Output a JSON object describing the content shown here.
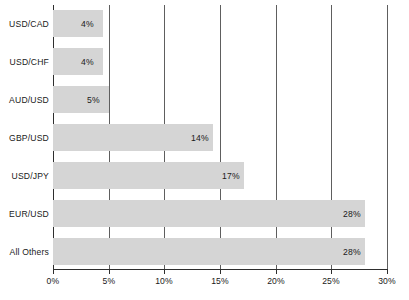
{
  "chart_data": {
    "type": "bar",
    "orientation": "horizontal",
    "title": "",
    "xlabel": "",
    "ylabel": "",
    "categories": [
      "USD/CAD",
      "USD/CHF",
      "AUD/USD",
      "GBP/USD",
      "USD/JPY",
      "EUR/USD",
      "All Others"
    ],
    "values": [
      4,
      5,
      5,
      14,
      17,
      28,
      28
    ],
    "data_labels": [
      "4%",
      "4%",
      "5%",
      "14%",
      "17%",
      "28%",
      "28%"
    ],
    "bar_end_percent": [
      4.5,
      4.5,
      5,
      14.4,
      17.2,
      28,
      28
    ],
    "xlim": [
      0,
      30
    ],
    "xticks": [
      0,
      5,
      10,
      15,
      20,
      25,
      30
    ],
    "xtick_labels": [
      "0%",
      "5%",
      "10%",
      "15%",
      "20%",
      "25%",
      "30%"
    ],
    "grid": true,
    "grid_axis": "x",
    "legend": false,
    "colors": {
      "bar_fill": "#d5d5d5",
      "gridline": "#5e5e5e",
      "axis": "#2e2e2e",
      "text": "#1a1a1a",
      "background": "#ffffff"
    }
  }
}
